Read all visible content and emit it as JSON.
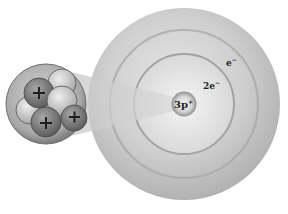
{
  "diagram": {
    "colors": {
      "background": "#ffffff",
      "outer_shell": "#b8b8b8",
      "ring": "#9a9a9a",
      "nucleus": "#8a8a8a",
      "proton": "#7a7a7a",
      "neutron": "#c8c8c8"
    },
    "labels": {
      "nucleus": {
        "base": "3p",
        "sup": "+"
      },
      "inner_shell": {
        "base": "2e",
        "sup": "−"
      },
      "outer_shell": {
        "base": "e",
        "sup": "−"
      }
    },
    "inset": {
      "description": "magnified-nucleus",
      "protons": 3,
      "neutrons": 4,
      "proton_symbol": "+"
    }
  }
}
